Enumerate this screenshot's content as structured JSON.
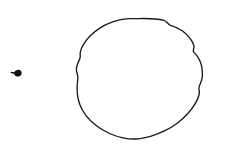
{
  "canvas": {
    "width": 226,
    "height": 155,
    "background_color": "#ffffff",
    "ink_color": "#1a1a1a",
    "description": "Minimal line drawing on a blank white background"
  },
  "shapes": [
    {
      "id": "small-blob",
      "name": "small-dark-blob-mark",
      "kind": "filled-blob-with-tail",
      "color": "#111111",
      "bounds": {
        "x": 13,
        "y": 69,
        "width": 10,
        "height": 9
      },
      "center": {
        "x": 18,
        "y": 73
      },
      "blob_path": "M 17.6 69.9 C 19.9 69.6 21.6 71.0 21.7 72.9 C 21.8 74.9 20.2 76.5 18.1 76.6 C 15.9 76.7 14.3 75.3 14.2 73.4 C 14.1 71.5 15.5 70.1 17.6 69.9 Z",
      "tail_path": "M 14.4 73.1 C 13.2 72.8 12.2 72.6 11.4 72.5"
    },
    {
      "id": "large-circle",
      "name": "large-hand-drawn-circle",
      "kind": "closed-freehand-outline",
      "color": "#1a1a1a",
      "stroke_width": 1.35,
      "bounds": {
        "x": 76,
        "y": 18,
        "width": 127,
        "height": 122
      },
      "center": {
        "x": 139,
        "y": 79
      },
      "outline_path": "M 139.0 18.6 C 150.0 18.3 158.5 19.0 164.2 20.3 C 166.6 22.2 168.2 24.1 170.4 25.3 C 174.4 26.4 178.8 28.2 182.6 31.0 C 186.0 33.6 188.6 36.4 190.8 39.3 C 192.6 41.9 193.7 44.2 194.1 46.6 C 193.6 48.6 193.2 50.1 193.4 51.6 C 194.6 53.3 196.3 54.7 197.6 56.6 C 199.3 59.2 200.6 62.1 201.4 65.2 C 202.3 68.8 202.6 72.4 202.4 75.9 C 202.1 79.0 201.3 81.6 200.3 83.8 C 199.4 85.5 198.8 86.9 198.9 88.4 C 199.2 90.3 199.6 92.0 199.2 94.0 C 198.6 97.0 197.3 100.1 195.5 103.2 C 193.4 106.8 190.9 110.2 188.1 113.3 C 185.0 116.7 181.6 119.9 177.9 122.7 C 173.8 125.8 169.5 128.5 165.0 130.7 C 160.3 133.0 155.5 134.9 150.5 136.3 C 146.0 137.6 141.8 138.4 138.1 138.8 C 133.4 139.3 128.8 139.0 124.1 138.1 C 119.1 137.1 114.2 135.6 109.5 133.5 C 104.6 131.3 100.0 128.6 95.8 125.3 C 92.0 122.3 88.7 119.0 85.9 115.3 C 83.3 111.9 81.3 108.4 79.9 104.7 C 78.6 101.2 77.8 97.8 77.4 94.3 C 77.0 90.7 77.0 87.2 77.3 83.8 C 77.6 81.1 78.0 78.8 77.8 76.6 C 77.5 74.3 76.6 72.4 76.4 70.2 C 76.2 67.8 76.8 65.6 77.8 63.4 C 78.7 61.4 79.7 59.6 80.1 57.6 C 80.4 55.7 80.0 54.1 80.3 52.2 C 80.7 49.6 81.9 47.0 83.5 44.4 C 85.4 41.3 87.8 38.3 90.5 35.6 C 93.5 32.6 96.9 29.9 100.6 27.6 C 104.6 25.1 108.9 23.1 113.4 21.6 C 118.3 20.0 123.4 19.1 128.6 18.7 C 132.1 18.5 135.6 18.6 139.0 18.6 Z"
    }
  ]
}
